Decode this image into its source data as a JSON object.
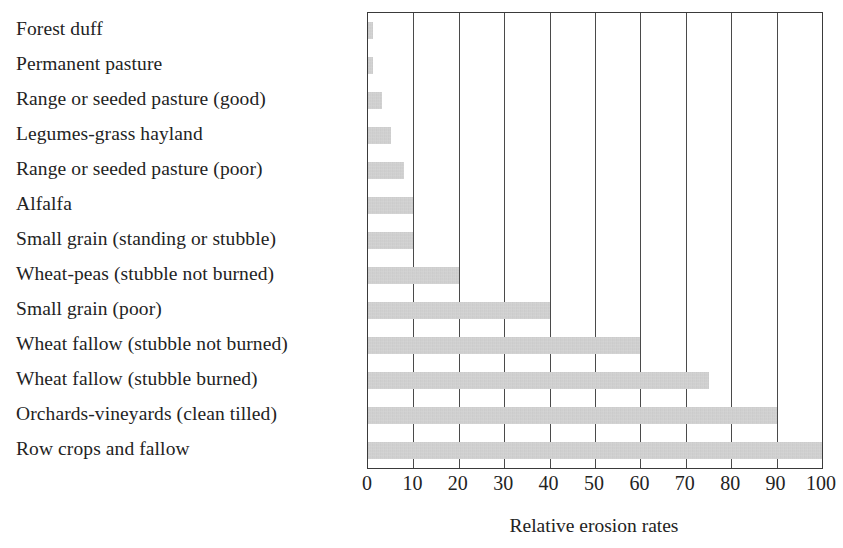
{
  "chart_data": {
    "type": "bar",
    "orientation": "horizontal",
    "title": "",
    "xlabel": "Relative erosion rates",
    "ylabel": "",
    "xlim": [
      0,
      100
    ],
    "xticks": [
      0,
      10,
      20,
      30,
      40,
      50,
      60,
      70,
      80,
      90,
      100
    ],
    "xtick_labels": [
      "0",
      "10",
      "20",
      "30",
      "40",
      "50",
      "60",
      "70",
      "80",
      "90",
      "100"
    ],
    "grid": "vertical",
    "legend": "none",
    "bar_color": "#c9c9c9",
    "frame_color": "#3a3a3a",
    "categories": [
      "Forest duff",
      "Permanent pasture",
      "Range or seeded pasture (good)",
      "Legumes-grass hayland",
      "Range or seeded pasture (poor)",
      "Alfalfa",
      "Small grain (standing or stubble)",
      "Wheat-peas (stubble not burned)",
      "Small grain (poor)",
      "Wheat fallow (stubble not burned)",
      "Wheat fallow (stubble burned)",
      "Orchards-vineyards (clean tilled)",
      "Row crops and fallow"
    ],
    "values": [
      1,
      1,
      3,
      5,
      8,
      10,
      10,
      20,
      40,
      60,
      75,
      90,
      100
    ]
  }
}
